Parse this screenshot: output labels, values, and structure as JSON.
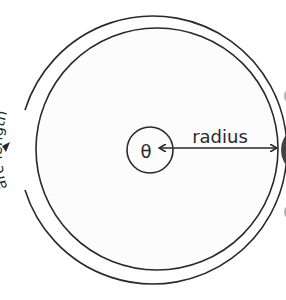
{
  "diagram": {
    "labels": {
      "theta": "θ",
      "radius": "radius",
      "arc_length": "arc-length"
    },
    "colors": {
      "background": "#ffffff",
      "stroke": "#2a2a2a",
      "edge_shadow": "#555555"
    }
  }
}
